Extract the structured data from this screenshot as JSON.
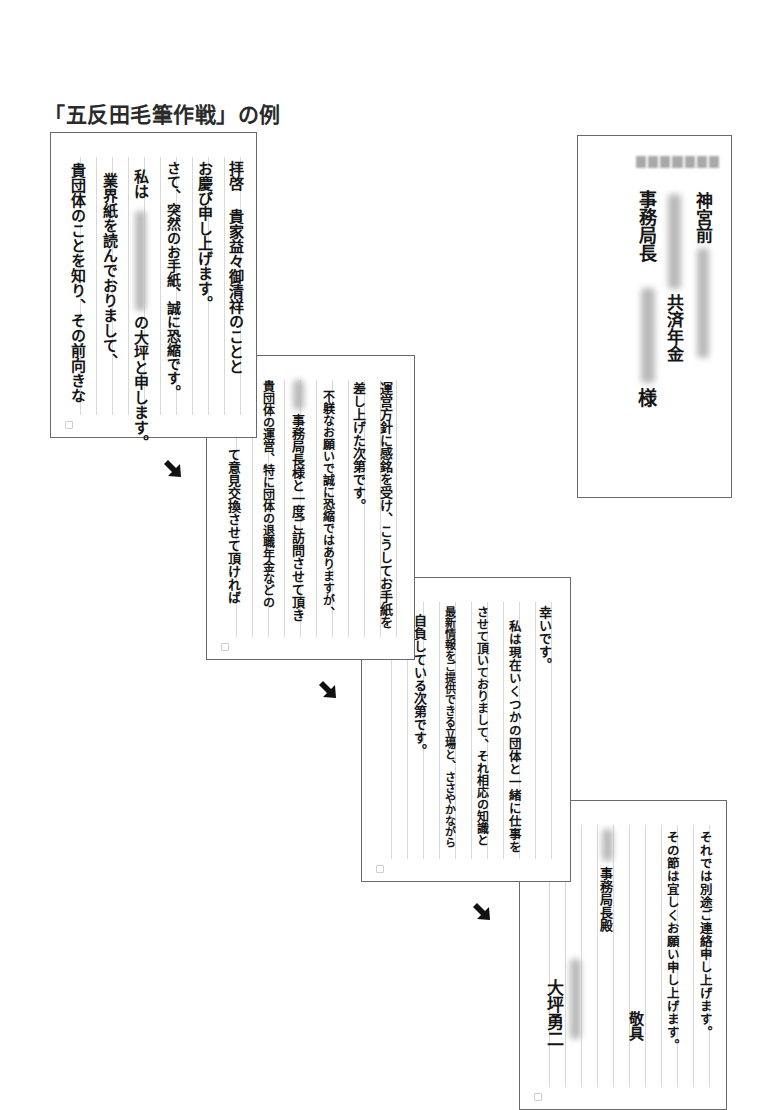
{
  "title": "「五反田毛筆作戦」の例",
  "envelope": {
    "address_line": "神宮前",
    "org_suffix": "共済年金",
    "recipient_title": "事務局長",
    "honorific": "様"
  },
  "pages": [
    {
      "columns": [
        "拝啓 貴家益々御清祥のことと",
        "お慶び申し上げます。",
        "さて、突然のお手紙、誠に恐縮です。",
        "私は",
        "の大坪と申します。",
        "業界紙を読んでおりまして、",
        "貴団体のことを知り、その前向きな"
      ]
    },
    {
      "columns": [
        "運営方針に感銘を受け、こうしてお手紙を",
        "差し上げた次第です。",
        "不躾なお願いで誠に恐縮ではありますが、",
        "事務局長様と一度ご訪問させて頂き",
        "貴団体の運営、特に団体の退職年金などの",
        "て意見交換させて頂ければ"
      ]
    },
    {
      "columns": [
        "幸いです。",
        "私は現在いくつかの団体と一緒に仕事を",
        "させて頂いておりまして、それ相応の知識と",
        "最新情報をご提供できる立場と、ささやかながら",
        "自負している次第です。"
      ]
    },
    {
      "columns": [
        "それでは別途ご連絡申し上げます。",
        "その節は宜しくお願い申し上げます。",
        "敬具",
        "事務局長殿",
        "大坪勇二"
      ]
    }
  ],
  "arrows": [
    "arrow-down-right",
    "arrow-down-right",
    "arrow-down-right"
  ],
  "colors": {
    "ink": "#151515",
    "border": "#6a6a6a",
    "rule": "#d8d8d8",
    "blur": "#b9b9b9"
  }
}
